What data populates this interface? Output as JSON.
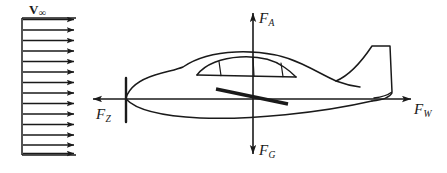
{
  "figure": {
    "background_color": "#ffffff",
    "line_color": "#1a1a1a",
    "width": 447,
    "height": 173
  },
  "flow": {
    "label": "V",
    "label_subscript": "∞",
    "arrow_count": 14,
    "box": {
      "x": 22,
      "y": 18,
      "width": 54,
      "height": 137
    },
    "direction": "right"
  },
  "forces": [
    {
      "id": "lift",
      "label": "F",
      "subscript": "A",
      "direction": "up",
      "axis": "vertical",
      "position": "top"
    },
    {
      "id": "weight",
      "label": "F",
      "subscript": "G",
      "direction": "down",
      "axis": "vertical",
      "position": "bottom"
    },
    {
      "id": "drag",
      "label": "F",
      "subscript": "Z",
      "direction": "left",
      "axis": "horizontal",
      "position": "left"
    },
    {
      "id": "thrust",
      "label": "F",
      "subscript": "W",
      "direction": "right",
      "axis": "horizontal",
      "position": "right"
    }
  ],
  "axes": {
    "horizontal": {
      "x1": 92,
      "x2": 412,
      "y": 99
    },
    "vertical": {
      "x": 253,
      "y1": 12,
      "y2": 155
    }
  },
  "aircraft": {
    "parts": [
      "fuselage",
      "canopy",
      "canopy-window-dividers",
      "wing",
      "vertical-stabilizer",
      "nose-tick"
    ]
  }
}
